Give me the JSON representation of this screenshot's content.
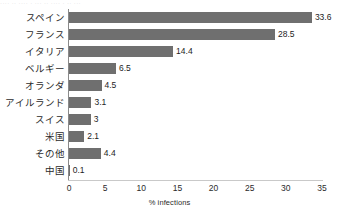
{
  "artifact": {
    "top_line": "    ···· ·· ···· · ··· ·· ···· · ·· ···"
  },
  "chart_data": {
    "type": "bar",
    "orientation": "horizontal",
    "title": "",
    "subtitle": "",
    "xlabel": "% infections",
    "ylabel": "",
    "categories": [
      "スペイン",
      "フランス",
      "イタリア",
      "ベルギー",
      "オランダ",
      "アイルランド",
      "スイス",
      "米国",
      "その他",
      "中国"
    ],
    "values": [
      33.6,
      28.5,
      14.4,
      6.5,
      4.5,
      3.1,
      3,
      2.1,
      4.4,
      0.1
    ],
    "value_labels": [
      "33.6",
      "28.5",
      "14.4",
      "6.5",
      "4.5",
      "3.1",
      "3",
      "2.1",
      "4.4",
      "0.1"
    ],
    "xlim": [
      0,
      35
    ],
    "xticks": [
      0,
      5,
      10,
      15,
      20,
      25,
      30,
      35
    ],
    "xtick_labels": [
      "0",
      "5",
      "10",
      "15",
      "20",
      "25",
      "30",
      "35"
    ],
    "grid": false,
    "legend": null,
    "bar_color": "#6f6f6f",
    "axis_color": "#8a8a8a",
    "text_color": "#2b2b2b",
    "background": "#ffffff"
  }
}
